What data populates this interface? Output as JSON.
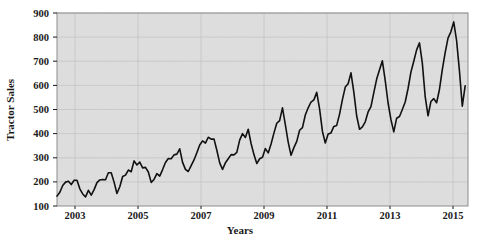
{
  "chart_data": {
    "type": "line",
    "title": "",
    "xlabel": "Years",
    "ylabel": "Tractor Sales",
    "xlim": [
      2003.0,
      2015.0
    ],
    "ylim": [
      100,
      900
    ],
    "ytick_labels": [
      "100",
      "200",
      "300",
      "400",
      "500",
      "600",
      "700",
      "800",
      "900"
    ],
    "yticks": [
      100,
      200,
      300,
      400,
      500,
      600,
      700,
      800,
      900
    ],
    "xtick_labels": [
      "2003",
      "2005",
      "2007",
      "2009",
      "2011",
      "2013",
      "2015"
    ],
    "xticks": [
      2003,
      2005,
      2007,
      2009,
      2011,
      2013,
      2015
    ],
    "grid": true,
    "legend": "none",
    "series": [
      {
        "name": "Tractor Sales",
        "x_start": 2003.0,
        "x_step": 0.0833333,
        "values": [
          141,
          157,
          185,
          199,
          203,
          189,
          207,
          207,
          171,
          150,
          138,
          165,
          145,
          168,
          197,
          208,
          210,
          209,
          238,
          238,
          199,
          152,
          180,
          222,
          228,
          249,
          242,
          287,
          270,
          282,
          258,
          260,
          241,
          198,
          210,
          234,
          224,
          251,
          280,
          297,
          296,
          312,
          315,
          337,
          281,
          252,
          243,
          267,
          291,
          321,
          353,
          370,
          361,
          385,
          377,
          378,
          331,
          279,
          252,
          279,
          296,
          313,
          312,
          322,
          373,
          400,
          384,
          418,
          359,
          313,
          276,
          296,
          302,
          338,
          320,
          357,
          402,
          443,
          454,
          507,
          437,
          365,
          310,
          342,
          368,
          414,
          425,
          477,
          507,
          531,
          540,
          571,
          503,
          409,
          361,
          398,
          403,
          430,
          434,
          481,
          541,
          593,
          607,
          652,
          572,
          473,
          418,
          428,
          449,
          490,
          512,
          570,
          626,
          665,
          702,
          620,
          527,
          458,
          407,
          464,
          471,
          500,
          531,
          587,
          655,
          700,
          747,
          776,
          692,
          553,
          474,
          533,
          545,
          528,
          583,
          665,
          736,
          796,
          822,
          863,
          786,
          660,
          514,
          598
        ]
      }
    ],
    "n_points": 144,
    "note_trend": "increasing",
    "note_seasonality": "annual"
  },
  "figure": {
    "width": 477,
    "height": 244,
    "background_color": "#ffffff",
    "plot_background_color": "#dedede",
    "gridline_color": "#c4c4c4",
    "line_color": "#111111",
    "frame_color": "#8d8d8d"
  },
  "plot_box": {
    "left": 57,
    "right": 468,
    "top": 13,
    "bottom": 206
  }
}
